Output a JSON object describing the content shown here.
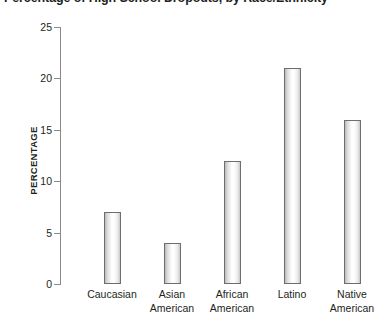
{
  "chart_data": {
    "type": "bar",
    "title": "Percentage of High School Dropouts, by Race/Ethnicity",
    "xlabel": "",
    "ylabel": "PERCENTAGE",
    "ylim": [
      0,
      25
    ],
    "ytick_step": 5,
    "yticks": [
      "25",
      "20",
      "15",
      "10",
      "5",
      "0"
    ],
    "grid": false,
    "legend": false,
    "categories": [
      "Caucasian",
      "Asian American",
      "African American",
      "Latino",
      "Native American"
    ],
    "category_lines": [
      [
        "Caucasian",
        ""
      ],
      [
        "Asian",
        "American"
      ],
      [
        "African",
        "American"
      ],
      [
        "Latino",
        ""
      ],
      [
        "Native",
        "American"
      ]
    ],
    "values": [
      7,
      4,
      12,
      21,
      16
    ],
    "colors": {
      "bar_border": "#6e6e6e",
      "bar_fill": "#ffffff",
      "axis": "#8a8a8a",
      "text": "#231f20",
      "background": "#ffffff"
    }
  }
}
